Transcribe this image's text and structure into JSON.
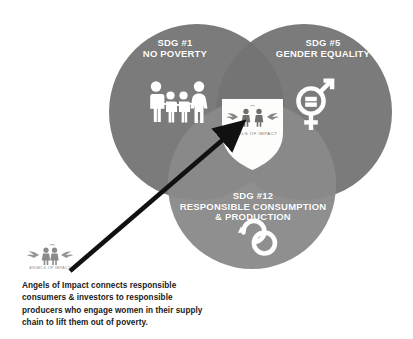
{
  "diagram": {
    "type": "venn",
    "title_visible": false,
    "background_color": "#ffffff",
    "circles": [
      {
        "id": "sdg1",
        "heading": "SDG #1",
        "subheading": "NO POVERTY",
        "icon": "family-of-four-icon",
        "fill_color": "#7b7b7b",
        "text_color": "#ffffff",
        "cx": 197,
        "cy": 112,
        "r": 88
      },
      {
        "id": "sdg5",
        "heading": "SDG #5",
        "subheading": "GENDER EQUALITY",
        "icon": "gender-equality-icon",
        "fill_color": "#7b7b7b",
        "text_color": "#ffffff",
        "cx": 304,
        "cy": 112,
        "r": 88
      },
      {
        "id": "sdg12",
        "heading": "SDG #12",
        "line2": "RESPONSIBLE CONSUMPTION",
        "line3": "& PRODUCTION",
        "icon": "infinity-icon",
        "fill_color": "#8f8f8f",
        "text_color": "#ffffff",
        "cx": 252,
        "cy": 185,
        "r": 84
      }
    ],
    "center": {
      "shape": "shield",
      "fill_color": "#fdfdfb",
      "logo_name": "angels-of-impact-logo",
      "logo_wordmark": "ANGELS OF IMPACT"
    },
    "arrow": {
      "name": "pointer-arrow",
      "color": "#111111",
      "from_x": 70,
      "from_y": 271,
      "to_x": 233,
      "to_y": 131
    }
  },
  "caption": {
    "logo_name": "angels-of-impact-logo",
    "logo_wordmark": "ANGELS OF IMPACT",
    "text": "Angels of Impact connects responsible consumers & investors to responsible producers who engage women in their supply chain to lift them out of poverty."
  }
}
